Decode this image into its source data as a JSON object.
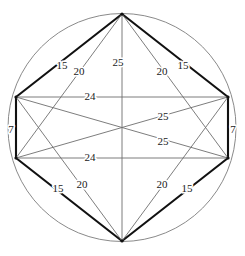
{
  "figure": {
    "background_color": "#ffffff",
    "circle": {
      "center_x": 122,
      "center_y": 127.5,
      "radius": 114,
      "stroke_color": "#8a8a8a",
      "stroke_width": 1
    },
    "colors": {
      "thin_chord": "#6e6e6e",
      "thick_chord": "#111111",
      "label_text": "#1a1a1a"
    },
    "vertices": [
      {
        "id": "top",
        "name": "vertex-top",
        "x": 122,
        "y": 14
      },
      {
        "id": "right_upper",
        "name": "vertex-right-upper",
        "x": 228,
        "y": 97
      },
      {
        "id": "right_lower",
        "name": "vertex-right-lower",
        "x": 228,
        "y": 158
      },
      {
        "id": "bottom",
        "name": "vertex-bottom",
        "x": 122,
        "y": 241
      },
      {
        "id": "left_lower",
        "name": "vertex-left-lower",
        "x": 16,
        "y": 158
      },
      {
        "id": "left_upper",
        "name": "vertex-left-upper",
        "x": 16,
        "y": 97
      }
    ],
    "edges": [
      {
        "id": "e-top-leftupper",
        "name": "edge-top-left-upper",
        "from": "top",
        "to": "left_upper",
        "weight": "thick",
        "label": "15",
        "label_x": 62,
        "label_y": 66
      },
      {
        "id": "e-top-rightupper",
        "name": "edge-top-right-upper",
        "from": "top",
        "to": "right_upper",
        "weight": "thick",
        "label": "15",
        "label_x": 183,
        "label_y": 66
      },
      {
        "id": "e-bottom-leftlower",
        "name": "edge-bottom-left-lower",
        "from": "bottom",
        "to": "left_lower",
        "weight": "thick",
        "label": "15",
        "label_x": 58,
        "label_y": 189
      },
      {
        "id": "e-bottom-rightlower",
        "name": "edge-bottom-right-lower",
        "from": "bottom",
        "to": "right_lower",
        "weight": "thick",
        "label": "15",
        "label_x": 187,
        "label_y": 189
      },
      {
        "id": "e-leftupper-leftlower",
        "name": "edge-left-upper-left-lower",
        "from": "left_upper",
        "to": "left_lower",
        "weight": "thick",
        "label": "7",
        "label_x": 11,
        "label_y": 130
      },
      {
        "id": "e-rightupper-rightlower",
        "name": "edge-right-upper-right-lower",
        "from": "right_upper",
        "to": "right_lower",
        "weight": "thick",
        "label": "7",
        "label_x": 233,
        "label_y": 130
      },
      {
        "id": "e-top-leftlower",
        "name": "chord-top-left-lower",
        "from": "top",
        "to": "left_lower",
        "weight": "thin",
        "label": "20",
        "label_x": 79,
        "label_y": 72
      },
      {
        "id": "e-top-rightlower",
        "name": "chord-top-right-lower",
        "from": "top",
        "to": "right_lower",
        "weight": "thin",
        "label": "20",
        "label_x": 162,
        "label_y": 72
      },
      {
        "id": "e-bottom-leftupper",
        "name": "chord-bottom-left-upper",
        "from": "bottom",
        "to": "left_upper",
        "weight": "thin",
        "label": "20",
        "label_x": 82,
        "label_y": 185
      },
      {
        "id": "e-bottom-rightupper",
        "name": "chord-bottom-right-upper",
        "from": "bottom",
        "to": "right_upper",
        "weight": "thin",
        "label": "20",
        "label_x": 162,
        "label_y": 185
      },
      {
        "id": "e-top-bottom",
        "name": "diameter-top-bottom",
        "from": "top",
        "to": "bottom",
        "weight": "thin",
        "label": "25",
        "label_x": 118,
        "label_y": 63
      },
      {
        "id": "e-leftupper-rightlower",
        "name": "chord-left-upper-right-lower",
        "from": "left_upper",
        "to": "right_lower",
        "weight": "thin",
        "label": "25",
        "label_x": 163,
        "label_y": 142
      },
      {
        "id": "e-leftlower-rightupper",
        "name": "chord-left-lower-right-upper",
        "from": "left_lower",
        "to": "right_upper",
        "weight": "thin",
        "label": "25",
        "label_x": 163,
        "label_y": 117
      },
      {
        "id": "e-leftupper-rightupper",
        "name": "chord-left-upper-right-upper",
        "from": "left_upper",
        "to": "right_upper",
        "weight": "thin",
        "label": "24",
        "label_x": 90,
        "label_y": 97
      },
      {
        "id": "e-leftlower-rightlower",
        "name": "chord-left-lower-right-lower",
        "from": "left_lower",
        "to": "right_lower",
        "weight": "thin",
        "label": "24",
        "label_x": 90,
        "label_y": 158
      }
    ]
  }
}
